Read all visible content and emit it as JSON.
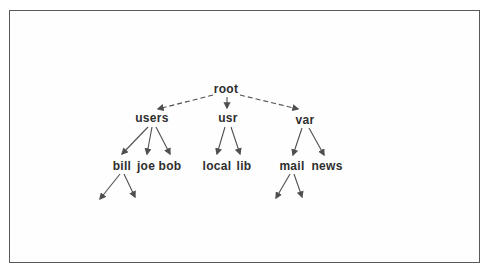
{
  "diagram": {
    "type": "tree",
    "nodes": {
      "root": "root",
      "users": "users",
      "usr": "usr",
      "var": "var",
      "bill": "bill",
      "joe": "joe",
      "bob": "bob",
      "local": "local",
      "lib": "lib",
      "mail": "mail",
      "news": "news"
    },
    "edges": [
      {
        "from": "root",
        "to": "users",
        "style": "dashed"
      },
      {
        "from": "root",
        "to": "usr",
        "style": "solid"
      },
      {
        "from": "root",
        "to": "var",
        "style": "dashed"
      },
      {
        "from": "users",
        "to": "bill",
        "style": "solid"
      },
      {
        "from": "users",
        "to": "joe",
        "style": "solid"
      },
      {
        "from": "users",
        "to": "bob",
        "style": "solid"
      },
      {
        "from": "usr",
        "to": "local",
        "style": "solid"
      },
      {
        "from": "usr",
        "to": "lib",
        "style": "solid"
      },
      {
        "from": "var",
        "to": "mail",
        "style": "solid"
      },
      {
        "from": "var",
        "to": "news",
        "style": "solid"
      },
      {
        "from": "bill",
        "to": "(unlabeled)",
        "style": "solid"
      },
      {
        "from": "bill",
        "to": "(unlabeled)",
        "style": "solid"
      },
      {
        "from": "mail",
        "to": "(unlabeled)",
        "style": "solid"
      },
      {
        "from": "mail",
        "to": "(unlabeled)",
        "style": "solid"
      }
    ],
    "colors": {
      "line": "#4f4f4f",
      "text": "#2e2e2e",
      "frame_border": "#585858",
      "background": "#ffffff"
    }
  }
}
